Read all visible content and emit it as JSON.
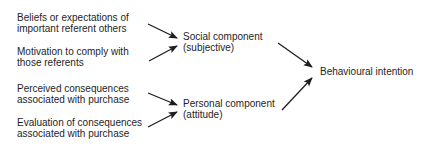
{
  "diagram": {
    "inputs": [
      {
        "line1": "Beliefs or expectations of",
        "line2": "important referent others"
      },
      {
        "line1": "Motivation to comply with",
        "line2": "those referents"
      },
      {
        "line1": "Perceived consequences",
        "line2": "associated with purchase"
      },
      {
        "line1": "Evaluation of consequences",
        "line2": "associated with purchase"
      }
    ],
    "components": [
      {
        "line1": "Social component",
        "line2": "(subjective)"
      },
      {
        "line1": "Personal component",
        "line2": "(attitude)"
      }
    ],
    "output": {
      "label": "Behavioural intention"
    },
    "colors": {
      "text": "#1e1e1e",
      "arrow": "#1e1e1e",
      "background": "#ffffff"
    }
  }
}
